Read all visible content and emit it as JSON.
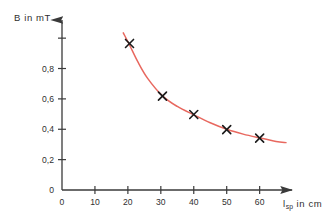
{
  "chart_data": {
    "type": "scatter",
    "title": "",
    "subtitle": "",
    "xlabel": "l_sp in cm",
    "xlabel_base": "l",
    "xlabel_sub": "sp",
    "xlabel_rest": " in cm",
    "ylabel": "B in mT",
    "xlim": [
      0,
      68
    ],
    "ylim": [
      0,
      1.08
    ],
    "grid": false,
    "legend": null,
    "xticks": [
      0,
      10,
      20,
      30,
      40,
      50,
      60
    ],
    "xticklabels": [
      "0",
      "10",
      "20",
      "30",
      "40",
      "50",
      "60"
    ],
    "yticks": [
      0,
      0.2,
      0.4,
      0.6,
      0.8,
      1.0
    ],
    "yticklabels": [
      "0",
      "0,2",
      "0,4",
      "0,6",
      "0,8",
      ""
    ],
    "marker": "x",
    "marker_color": "#1a1a1a",
    "curve_color": "#e8685f",
    "axis_color": "#3a3a3a",
    "background": "#ffffff",
    "series": [
      {
        "name": "B measurements",
        "points": [
          {
            "x": 20.5,
            "y": 0.965
          },
          {
            "x": 30.5,
            "y": 0.618
          },
          {
            "x": 40.0,
            "y": 0.497
          },
          {
            "x": 50.0,
            "y": 0.398
          },
          {
            "x": 60.0,
            "y": 0.342
          }
        ]
      }
    ],
    "fit_curve": {
      "name": "fitted hyperbola",
      "points": [
        {
          "x": 18.6,
          "y": 1.035
        },
        {
          "x": 20.5,
          "y": 0.955
        },
        {
          "x": 23.0,
          "y": 0.845
        },
        {
          "x": 26.0,
          "y": 0.735
        },
        {
          "x": 30.5,
          "y": 0.62
        },
        {
          "x": 35.0,
          "y": 0.55
        },
        {
          "x": 40.0,
          "y": 0.495
        },
        {
          "x": 45.0,
          "y": 0.443
        },
        {
          "x": 50.0,
          "y": 0.4
        },
        {
          "x": 55.0,
          "y": 0.368
        },
        {
          "x": 60.0,
          "y": 0.343
        },
        {
          "x": 65.0,
          "y": 0.32
        },
        {
          "x": 68.0,
          "y": 0.312
        }
      ]
    }
  }
}
